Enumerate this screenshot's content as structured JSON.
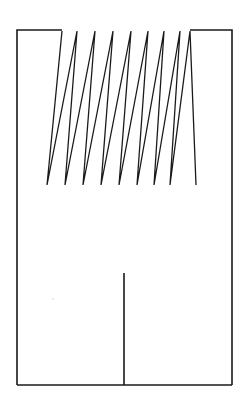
{
  "figure": {
    "canvas": {
      "width": 250,
      "height": 407,
      "background_color": "#ffffff"
    },
    "stroke": {
      "color": "#1a1a1a",
      "width_px": 1.6,
      "thin_width_px": 1.3,
      "line_join": "miter",
      "line_cap": "butt"
    },
    "frame": {
      "label": "outer-frame",
      "left_x": 17,
      "right_x": 232,
      "top_y": 30,
      "bottom_y": 385,
      "note": "Top edge is interrupted by the zigzag; only the left and right box tops remain."
    },
    "left_box": {
      "label": "left-open-box",
      "left_x": 17,
      "right_x": 62,
      "top_y": 30,
      "bottom_y": 385,
      "open_side": "bottom-right"
    },
    "right_box": {
      "label": "right-open-box",
      "left_x": 190,
      "right_x": 232,
      "top_y": 30,
      "bottom_y": 385,
      "open_side": "bottom-left"
    },
    "zigzag": {
      "label": "sawtooth-trace",
      "peak_y": 31,
      "valley_y": 185,
      "peak_count": 8,
      "valley_count": 9,
      "start_point": [
        62,
        31
      ],
      "end_point": [
        190,
        31
      ],
      "points": [
        [
          62,
          31
        ],
        [
          47,
          185
        ],
        [
          77,
          31
        ],
        [
          65,
          185
        ],
        [
          95,
          31
        ],
        [
          83,
          185
        ],
        [
          113,
          31
        ],
        [
          101,
          185
        ],
        [
          131,
          31
        ],
        [
          119,
          185
        ],
        [
          148,
          31
        ],
        [
          137,
          185
        ],
        [
          164,
          31
        ],
        [
          154,
          185
        ],
        [
          180,
          31
        ],
        [
          170,
          185
        ],
        [
          190,
          31
        ],
        [
          196,
          185
        ]
      ]
    },
    "centre_tick": {
      "label": "centre-vertical-tick",
      "x": 124,
      "top_y": 273,
      "bottom_y": 385
    },
    "baseline": {
      "label": "bottom-edge",
      "left_x": 17,
      "right_x": 232,
      "y": 385
    },
    "artifacts": [
      {
        "label": "scan-speck",
        "x": 52,
        "y": 298
      }
    ]
  },
  "chart_data": {
    "type": "line",
    "xlabel": "",
    "ylabel": "",
    "grid": false,
    "legend": "none",
    "xlim": [
      17,
      232
    ],
    "ylim": [
      385,
      30
    ],
    "series": [
      {
        "name": "zigzag",
        "x": [
          62,
          47,
          77,
          65,
          95,
          83,
          113,
          101,
          131,
          119,
          148,
          137,
          164,
          154,
          180,
          170,
          190,
          196
        ],
        "y": [
          31,
          185,
          31,
          185,
          31,
          185,
          31,
          185,
          31,
          185,
          31,
          185,
          31,
          185,
          31,
          185,
          31,
          185
        ]
      }
    ],
    "annotations": [
      "8 full sawtooth peaks between the flanking boxes",
      "peaks clipped flat at the frame top line",
      "valleys terminate in free ends at y = 185"
    ]
  }
}
